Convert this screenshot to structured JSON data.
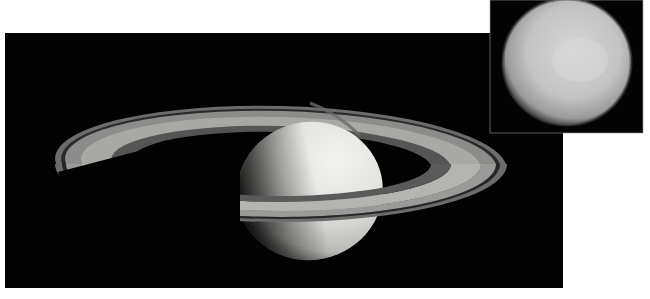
{
  "image": {
    "subject": "Saturn with rings and inset of moon Titan",
    "background_color": "#ffffff",
    "space_color": "#020202"
  },
  "main_panel": {
    "label": "saturn",
    "planet_light": "#e9e9e6",
    "planet_shadow": "#2a2a2a",
    "ring_outer": "#6e6e6e",
    "ring_mid": "#9a9a98",
    "ring_inner": "#bdbdba",
    "division": "#202020"
  },
  "inset_panel": {
    "label": "titan",
    "disk_light": "#cfcfcf",
    "disk_edge": "#5a5a5a"
  }
}
